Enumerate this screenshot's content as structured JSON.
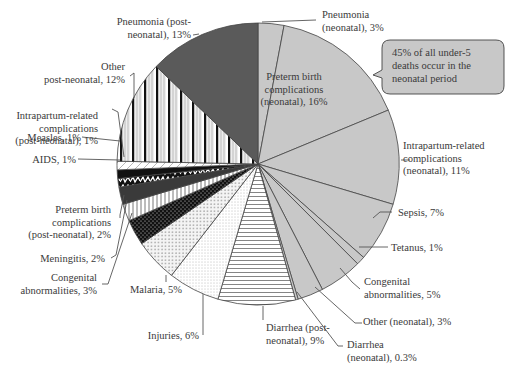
{
  "chart_data": {
    "type": "pie",
    "title": "",
    "start_angle_deg": 0,
    "direction": "clockwise",
    "center": [
      258,
      164
    ],
    "radius": 141,
    "slices": [
      {
        "label": "Pneumonia (neonatal), 3%",
        "category": "Pneumonia (neonatal)",
        "value": 3,
        "period": "neonatal",
        "fill": "#c8c8c8",
        "pattern": "solid-light"
      },
      {
        "label": "Preterm birth complications (neonatal), 16%",
        "category": "Preterm birth complications (neonatal)",
        "value": 16,
        "period": "neonatal",
        "fill": "#c8c8c8",
        "pattern": "solid-light"
      },
      {
        "label": "Intrapartum-related complications (neonatal), 11%",
        "category": "Intrapartum-related complications (neonatal)",
        "value": 11,
        "period": "neonatal",
        "fill": "#c8c8c8",
        "pattern": "solid-light"
      },
      {
        "label": "Sepsis, 7%",
        "category": "Sepsis",
        "value": 7,
        "period": "neonatal",
        "fill": "#c8c8c8",
        "pattern": "solid-light"
      },
      {
        "label": "Tetanus, 1%",
        "category": "Tetanus",
        "value": 1,
        "period": "neonatal",
        "fill": "#c8c8c8",
        "pattern": "solid-light"
      },
      {
        "label": "Congenital abnormalities, 5%",
        "category": "Congenital abnormalities (neonatal)",
        "value": 5,
        "period": "neonatal",
        "fill": "#c8c8c8",
        "pattern": "solid-light"
      },
      {
        "label": "Other (neonatal), 3%",
        "category": "Other (neonatal)",
        "value": 3,
        "period": "neonatal",
        "fill": "#c8c8c8",
        "pattern": "solid-light"
      },
      {
        "label": "Diarrhea (neonatal), 0.3%",
        "category": "Diarrhea (neonatal)",
        "value": 0.3,
        "period": "neonatal",
        "fill": "#c8c8c8",
        "pattern": "solid-light"
      },
      {
        "label": "Diarrhea (post-neonatal), 9%",
        "category": "Diarrhea (post-neonatal)",
        "value": 9,
        "period": "post-neonatal",
        "fill": "#ffffff",
        "pattern": "horizontal-lines"
      },
      {
        "label": "Injuries, 6%",
        "category": "Injuries",
        "value": 6,
        "period": "post-neonatal",
        "fill": "#ffffff",
        "pattern": "fine-dots"
      },
      {
        "label": "Malaria, 5%",
        "category": "Malaria",
        "value": 5,
        "period": "post-neonatal",
        "fill": "#ffffff",
        "pattern": "dots"
      },
      {
        "label": "Congenital abnormalities, 3%",
        "category": "Congenital abnormalities (post-neonatal)",
        "value": 3,
        "period": "post-neonatal",
        "fill": "#111111",
        "pattern": "black-with-white-dots"
      },
      {
        "label": "Meningitis, 2%",
        "category": "Meningitis",
        "value": 2,
        "period": "post-neonatal",
        "fill": "#ffffff",
        "pattern": "vertical-lines"
      },
      {
        "label": "Preterm birth complications (post-neonatal), 2%",
        "category": "Preterm birth complications (post-neonatal)",
        "value": 2,
        "period": "post-neonatal",
        "fill": "#3a3a3a",
        "pattern": "solid-dark"
      },
      {
        "label": "AIDS, 1%",
        "category": "AIDS",
        "value": 1,
        "period": "post-neonatal",
        "fill": "#111111",
        "pattern": "zigzag"
      },
      {
        "label": "Measles, 1%",
        "category": "Measles",
        "value": 1,
        "period": "post-neonatal",
        "fill": "#111111",
        "pattern": "solid-black"
      },
      {
        "label": "Intrapartum-related complications (post-neonatal), 1%",
        "category": "Intrapartum-related complications (post-neonatal)",
        "value": 1,
        "period": "post-neonatal",
        "fill": "#ffffff",
        "pattern": "diagonal-light"
      },
      {
        "label": "Other post-neonatal, 12%",
        "category": "Other post-neonatal",
        "value": 12,
        "period": "post-neonatal",
        "fill": "#ffffff",
        "pattern": "vertical-stripes"
      },
      {
        "label": "Pneumonia (post-neonatal), 13%",
        "category": "Pneumonia (post-neonatal)",
        "value": 13,
        "period": "post-neonatal",
        "fill": "#5a5a5a",
        "pattern": "solid-dark"
      }
    ],
    "annotation": "45% of all under-5 deaths occur in the neonatal period",
    "legend": "none (direct labels with leader lines)"
  },
  "labels": {
    "pneumonia_neonatal": [
      "Pneumonia",
      "(neonatal), 3%"
    ],
    "preterm_neonatal": [
      "Preterm birth",
      "complications",
      "(neonatal), 16%"
    ],
    "intrapartum_neonatal": [
      "Intrapartum-related",
      "complications",
      "(neonatal), 11%"
    ],
    "sepsis": [
      "Sepsis, 7%"
    ],
    "tetanus": [
      "Tetanus, 1%"
    ],
    "congenital_neonatal": [
      "Congenital",
      "abnormalities, 5%"
    ],
    "other_neonatal": [
      "Other (neonatal), 3%"
    ],
    "diarrhea_neonatal": [
      "Diarrhea",
      "(neonatal), 0.3%"
    ],
    "diarrhea_post": [
      "Diarrhea (post-",
      "neonatal), 9%"
    ],
    "injuries": [
      "Injuries, 6%"
    ],
    "malaria": [
      "Malaria, 5%"
    ],
    "congenital_post": [
      "Congenital",
      "abnormalities, 3%"
    ],
    "meningitis": [
      "Meningitis, 2%"
    ],
    "preterm_post": [
      "Preterm birth",
      "complications",
      "(post-neonatal), 2%"
    ],
    "aids": [
      "AIDS, 1%"
    ],
    "measles": [
      "Measles, 1%"
    ],
    "intrapartum_post": [
      "Intrapartum-related",
      "complications",
      "(post-neonatal), 1%"
    ],
    "other_post": [
      "Other",
      "post-neonatal, 12%"
    ],
    "pneumonia_post": [
      "Pneumonia (post-",
      "neonatal), 13%"
    ]
  },
  "callout": {
    "lines": [
      "45% of all under-5",
      "deaths occur in the",
      "neonatal period"
    ],
    "fill": "#c8c8c8"
  }
}
